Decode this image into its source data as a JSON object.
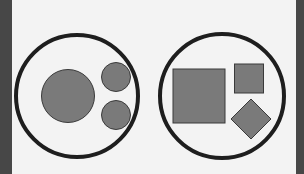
{
  "diagram": {
    "colors": {
      "background": "#f3f3f3",
      "side_band": "#474747",
      "outline": "#1e1e1e",
      "shape_fill": "#7a7a7a",
      "shape_stroke": "#3a3a3a"
    },
    "groups": [
      {
        "name": "circles-group",
        "container": {
          "cx": 77,
          "cy": 96,
          "r": 61
        },
        "shapes": [
          {
            "type": "circle",
            "cx": 68,
            "cy": 96,
            "r": 27
          },
          {
            "type": "circle",
            "cx": 116,
            "cy": 77,
            "r": 15
          },
          {
            "type": "circle",
            "cx": 116,
            "cy": 114,
            "r": 15
          }
        ]
      },
      {
        "name": "squares-group",
        "container": {
          "cx": 222,
          "cy": 96,
          "r": 61
        },
        "shapes": [
          {
            "type": "square",
            "x": 173,
            "y": 69,
            "w": 52,
            "h": 54
          },
          {
            "type": "square",
            "x": 234,
            "y": 64,
            "w": 29,
            "h": 29
          },
          {
            "type": "diamond",
            "cx": 251,
            "cy": 119,
            "half": 20
          }
        ]
      }
    ]
  }
}
